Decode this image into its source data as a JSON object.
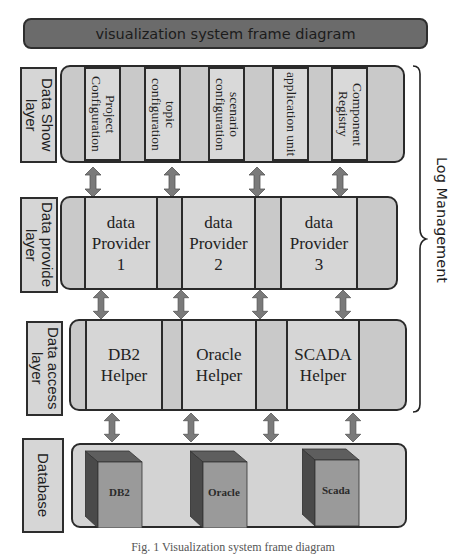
{
  "title": "visualization system frame diagram",
  "colors": {
    "title_bg": "#6b6b6b",
    "panel_bg": "#c9c9c9",
    "box_bg": "#d9d9d9",
    "arrow": "#7a7a7a",
    "cube_front": "#9a9a9a",
    "cube_side": "#4a4a4a",
    "cube_top": "#5e5e5e",
    "border": "#2a2a2a"
  },
  "layers": [
    {
      "label": "Data Show layer",
      "items": [
        "Project Configuration",
        "topic configuration",
        "scenario configuration",
        "application unit",
        "Component Registry"
      ]
    },
    {
      "label": "Data provide layer",
      "items": [
        "data\nProvider\n1",
        "data\nProvider\n2",
        "data\nProvider\n3"
      ]
    },
    {
      "label": "Data access layer",
      "items": [
        "DB2\nHelper",
        "Oracle\nHelper",
        "SCADA\nHelper"
      ]
    },
    {
      "label": "Database",
      "items": [
        "DB2",
        "Oracle",
        "Scada"
      ]
    }
  ],
  "side_annotation": "Log Management",
  "caption": "Fig. 1 Visualization system frame diagram"
}
